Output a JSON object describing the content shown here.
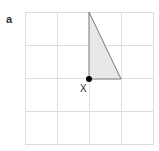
{
  "figure": {
    "panel_label": "a",
    "point_label": "X",
    "grid": {
      "cols": 4,
      "rows": 4,
      "line_color": "#dddddd"
    },
    "triangle": {
      "fill": "#e8e8e8",
      "stroke": "#777777"
    },
    "point_color": "#000000"
  }
}
